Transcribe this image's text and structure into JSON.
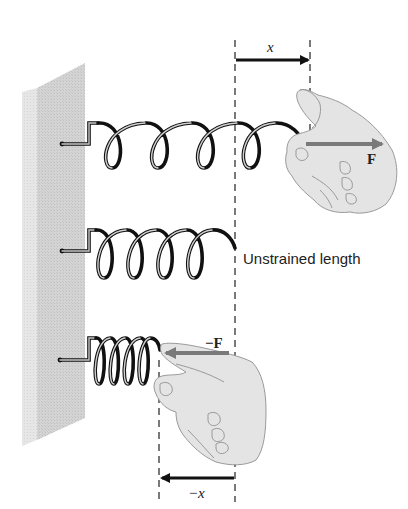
{
  "diagram": {
    "type": "physics-illustration",
    "colors": {
      "background": "#ffffff",
      "wall_front": "#d6d6d6",
      "wall_side": "#e8e8e8",
      "spring_dark": "#111111",
      "spring_light": "#bdbdbd",
      "hand_fill": "#e4e4e4",
      "hand_outline": "#9a9a9a",
      "force_arrow": "#7a7a7a",
      "displacement_arrow": "#111111",
      "dashed_line": "#333333"
    },
    "springs": [
      {
        "state": "stretched",
        "coils": 4
      },
      {
        "state": "unstrained",
        "coils": 4
      },
      {
        "state": "compressed",
        "coils": 4
      }
    ]
  },
  "labels": {
    "stretch_displacement": "x",
    "stretch_force": "F",
    "unstrained": "Unstrained length",
    "compress_force": "−F",
    "compress_displacement": "−x"
  }
}
